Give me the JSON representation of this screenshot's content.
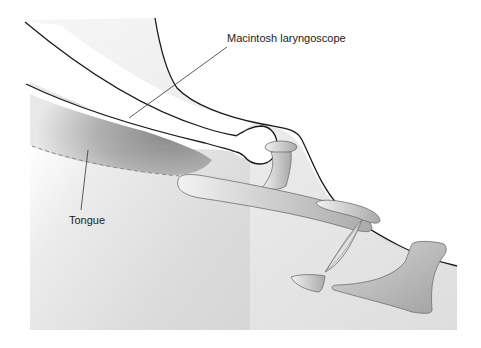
{
  "diagram": {
    "type": "anatomical-illustration",
    "labels": [
      {
        "id": "laryngoscope",
        "text": "Macintosh laryngoscope",
        "pointer_to": "blade"
      },
      {
        "id": "tongue",
        "text": "Tongue",
        "pointer_to": "tongue-shaded-region"
      }
    ],
    "colors": {
      "background": "#ffffff",
      "tissue_fill": "#d9d9d9",
      "tissue_light": "#ececec",
      "blade_fill": "#ffffff",
      "tongue_dark": "#8c8c8c",
      "outline": "#1a1a1a",
      "structure_outline": "#6e6e6e",
      "structure_fill": "#bdbdbd"
    }
  }
}
